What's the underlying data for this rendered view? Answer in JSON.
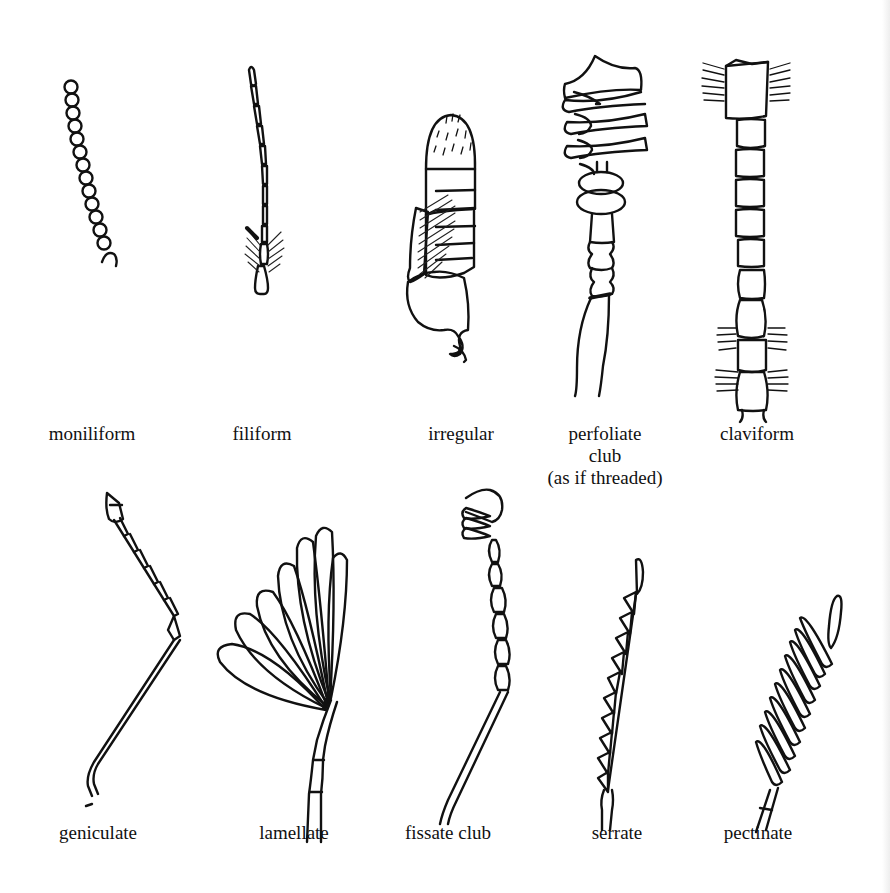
{
  "figure": {
    "rows": [
      {
        "items": [
          {
            "id": "moniliform",
            "label": "moniliform"
          },
          {
            "id": "filiform",
            "label": "filiform"
          },
          {
            "id": "irregular",
            "label": "irregular"
          },
          {
            "id": "perfoliate-club",
            "label": "perfoliate",
            "label_line2": "club",
            "label_line3": "(as if threaded)"
          },
          {
            "id": "claviform",
            "label": "claviform"
          }
        ]
      },
      {
        "items": [
          {
            "id": "geniculate",
            "label": "geniculate"
          },
          {
            "id": "lamellate",
            "label": "lamellate"
          },
          {
            "id": "fissate-club",
            "label": "fissate club"
          },
          {
            "id": "serrate",
            "label": "serrate"
          },
          {
            "id": "pectinate",
            "label": "pectinate"
          }
        ]
      }
    ],
    "colors": {
      "ink": "#111111",
      "paper": "#ffffff"
    }
  }
}
